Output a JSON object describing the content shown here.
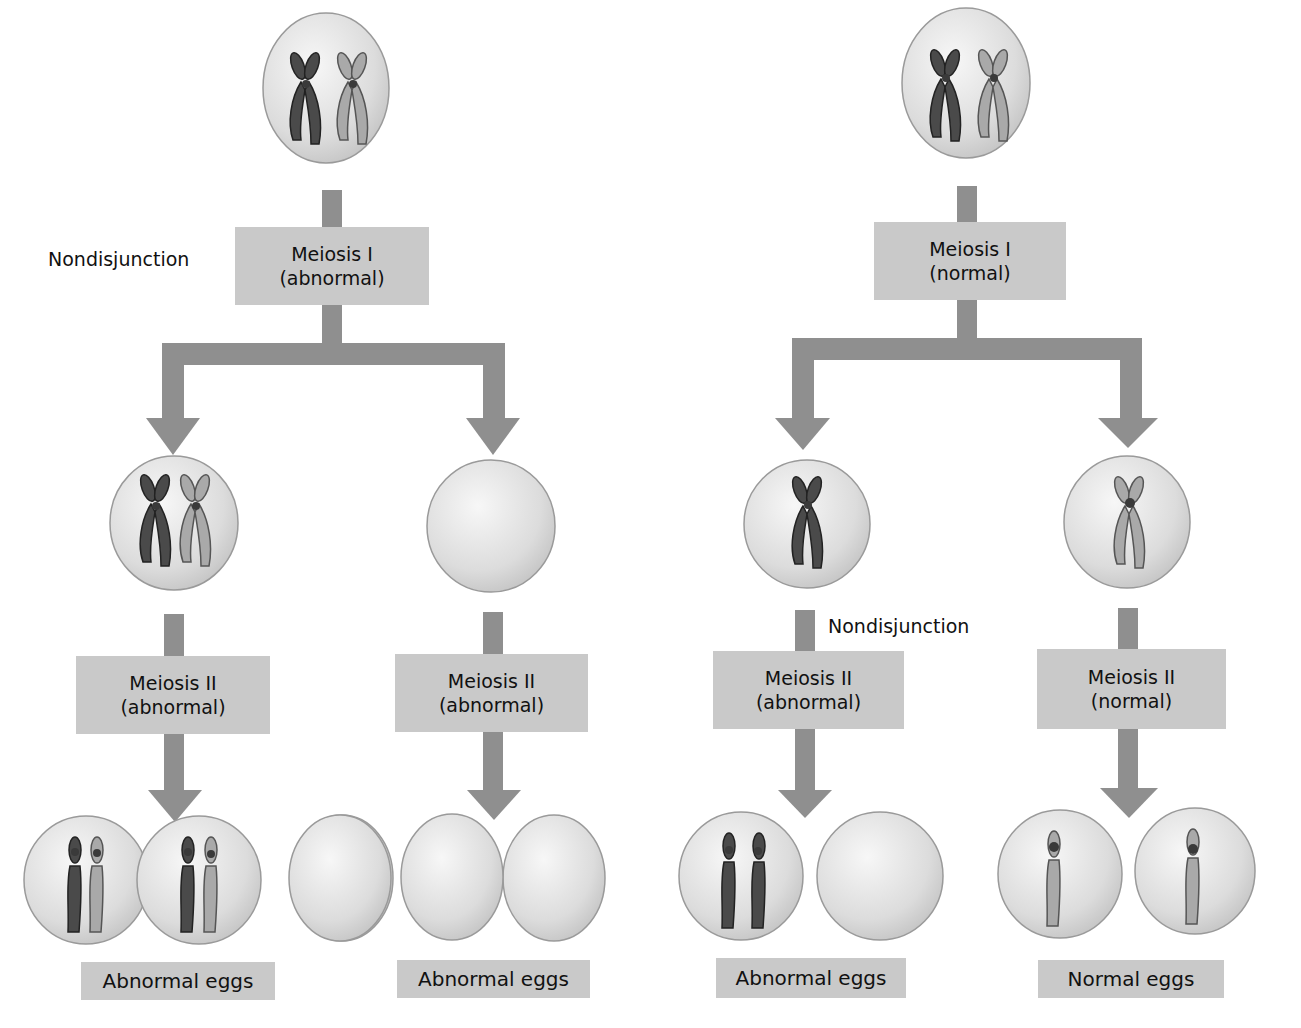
{
  "colors": {
    "arrow": "#8f8f8f",
    "label_bg": "#c9c9c9",
    "cell_fill": "#e6e6e6",
    "cell_edge": "#9a9a9a",
    "chrom_dark": "#4a4a4a",
    "chrom_light": "#a9a9a9",
    "centromere": "#3a3a3a"
  },
  "left_pathway": {
    "nondisjunction_label": "Nondisjunction",
    "meiosis1": {
      "line1": "Meiosis I",
      "line2": "(abnormal)"
    },
    "branch_left": {
      "meiosis2": {
        "line1": "Meiosis II",
        "line2": "(abnormal)"
      },
      "result_label": "Abnormal eggs"
    },
    "branch_right": {
      "meiosis2": {
        "line1": "Meiosis II",
        "line2": "(abnormal)"
      },
      "result_label": "Abnormal eggs"
    }
  },
  "right_pathway": {
    "nondisjunction_label": "Nondisjunction",
    "meiosis1": {
      "line1": "Meiosis I",
      "line2": "(normal)"
    },
    "branch_left": {
      "meiosis2": {
        "line1": "Meiosis II",
        "line2": "(abnormal)"
      },
      "result_label": "Abnormal eggs"
    },
    "branch_right": {
      "meiosis2": {
        "line1": "Meiosis II",
        "line2": "(normal)"
      },
      "result_label": "Normal eggs"
    }
  }
}
